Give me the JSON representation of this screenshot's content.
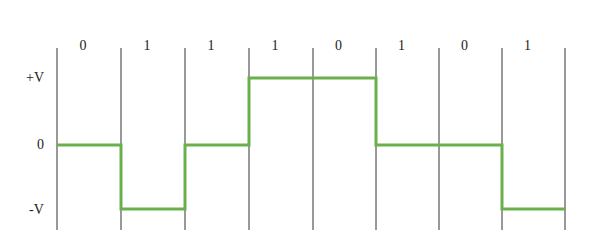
{
  "diagram": {
    "title": "",
    "encoding_bits": [
      "0",
      "1",
      "1",
      "1",
      "0",
      "1",
      "0",
      "1"
    ],
    "levels": {
      "pos": "+V",
      "zero": "0",
      "neg": "-V"
    },
    "signal_levels": [
      "zero",
      "neg",
      "zero",
      "pos",
      "pos",
      "zero",
      "zero",
      "neg"
    ],
    "colors": {
      "signal": "#6ab04c",
      "grid": "#333333",
      "text": "#222222"
    }
  }
}
